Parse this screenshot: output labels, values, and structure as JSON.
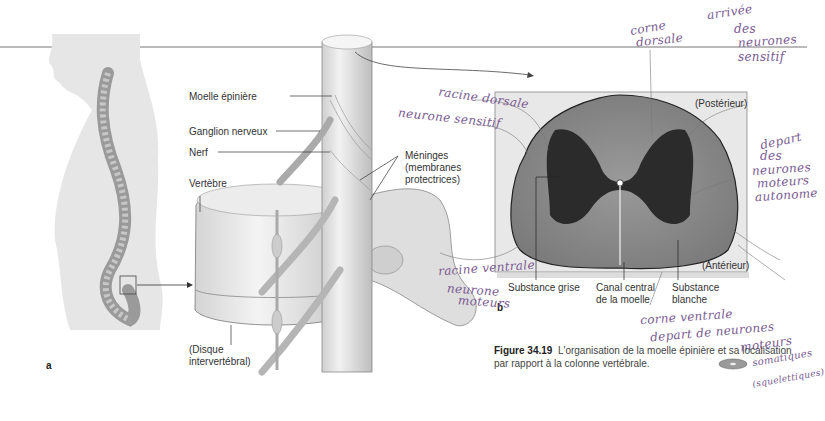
{
  "figure": {
    "number": "Figure 34.19",
    "caption": "L'organisation de la moelle épinière et sa localisation par rapport à la colonne vertébrale.",
    "panels": [
      "a",
      "b"
    ]
  },
  "panel_a_labels": {
    "spinal_cord": "Moelle épinière",
    "ganglion": "Ganglion nerveux",
    "nerve": "Nerf",
    "meninges_1": "Méninges",
    "meninges_2": "(membranes",
    "meninges_3": "protectrices)",
    "vertebra": "Vertèbre",
    "disc_1": "(Disque",
    "disc_2": "intervertébral)"
  },
  "panel_b_labels": {
    "posterior": "(Postérieur)",
    "anterior": "(Antérieur)",
    "grey_matter": "Substance grise",
    "central_canal_1": "Canal central",
    "central_canal_2": "de la moelle",
    "white_matter_1": "Substance",
    "white_matter_2": "blanche"
  },
  "handwritten_notes": {
    "dorsal_horn_1": "corne",
    "dorsal_horn_2": "dorsale",
    "arrival_1": "arrivée",
    "arrival_2": "des",
    "arrival_3": "neurones",
    "arrival_4": "sensitif",
    "dorsal_root": "racine dorsale",
    "sensory_neuron": "neurone sensitif",
    "autonomic_1": "depart",
    "autonomic_2": "des",
    "autonomic_3": "neurones",
    "autonomic_4": "moteurs",
    "autonomic_5": "autonome",
    "ventral_root": "racine ventrale",
    "motor_neuron_1": "neurone",
    "motor_neuron_2": "moteurs",
    "ventral_horn_1": "corne ventrale",
    "ventral_horn_2": "depart de neurones",
    "ventral_horn_3": "moteurs",
    "ventral_horn_4": "somatiques",
    "ventral_horn_5": "(squelettiques)"
  },
  "colors": {
    "ink": "#7a5a92",
    "label_text": "#333333",
    "grey_matter": "#2b2b2b",
    "white_matter": "#8c8c8c",
    "body_silhouette": "#e6e6e6"
  }
}
